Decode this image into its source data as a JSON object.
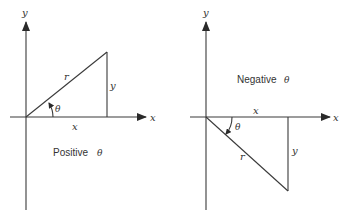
{
  "figures": [
    {
      "id": "positive",
      "caption": "Positive",
      "caption_symbol": "θ",
      "axis_labels": {
        "x": "x",
        "y": "y"
      },
      "side_labels": {
        "hyp": "r",
        "adj": "x",
        "opp": "y"
      },
      "angle_label": "θ",
      "direction": "counterclockwise"
    },
    {
      "id": "negative",
      "caption": "Negative",
      "caption_symbol": "θ",
      "axis_labels": {
        "x": "x",
        "y": "y"
      },
      "side_labels": {
        "hyp": "r",
        "adj": "x",
        "opp": "y"
      },
      "angle_label": "θ",
      "direction": "clockwise"
    }
  ],
  "colors": {
    "line": "#3a3a3a",
    "text": "#333333",
    "background": "#ffffff"
  }
}
